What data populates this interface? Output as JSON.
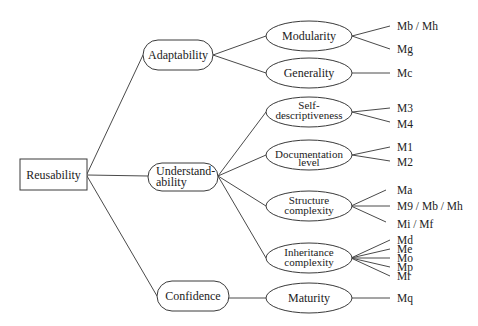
{
  "diagram": {
    "type": "tree",
    "root": {
      "label": "Reusability"
    },
    "factors": [
      {
        "label": "Adaptability"
      },
      {
        "label_line1": "Understand-",
        "label_line2": "ability"
      },
      {
        "label": "Confidence"
      }
    ],
    "criteria": [
      {
        "label": "Modularity",
        "parent": "Adaptability"
      },
      {
        "label": "Generality",
        "parent": "Adaptability"
      },
      {
        "label_line1": "Self-",
        "label_line2": "descriptiveness",
        "parent": "Understandability"
      },
      {
        "label_line1": "Documentation",
        "label_line2": "level",
        "parent": "Understandability"
      },
      {
        "label_line1": "Structure",
        "label_line2": "complexity",
        "parent": "Understandability"
      },
      {
        "label_line1": "Inheritance",
        "label_line2": "complexity",
        "parent": "Understandability"
      },
      {
        "label": "Maturity",
        "parent": "Confidence"
      }
    ],
    "metrics": {
      "modularity": [
        "Mb / Mh",
        "Mg"
      ],
      "generality": [
        "Mc"
      ],
      "self_descriptiveness": [
        "M3",
        "M4"
      ],
      "documentation_level": [
        "M1",
        "M2"
      ],
      "structure_complexity": [
        "Ma",
        "M9 / Mb / Mh",
        "Mi / Mf"
      ],
      "inheritance_complexity": [
        "Md",
        "Me",
        "Mo",
        "Mp",
        "Mr"
      ],
      "maturity": [
        "Mq"
      ]
    }
  }
}
